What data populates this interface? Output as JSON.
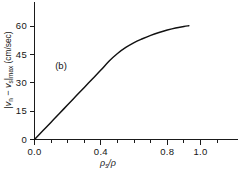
{
  "chart_data": {
    "type": "line",
    "title": "",
    "subtitle": "",
    "panel_label": "(b)",
    "xlabel": "ρs/ρ",
    "xlabel_main": "ρ",
    "xlabel_sub": "s",
    "xlabel_tail": "/ρ",
    "ylabel": "|vn − vs|max (cm/sec)",
    "ylabel_parts": {
      "bar_open": "|",
      "v1": "v",
      "v1_sub": "n",
      "dash": " − ",
      "v2": "v",
      "v2_sub": "s",
      "bar_close": "|",
      "max_sub": "max",
      "units": " (cm/sec)"
    },
    "xlim": [
      0.0,
      1.22
    ],
    "ylim": [
      0,
      72
    ],
    "xticks": [
      0.0,
      0.4,
      0.8,
      1.0
    ],
    "xticklabels": [
      "0.0",
      "0.4",
      "0.8",
      "1.0"
    ],
    "xminor_ticks": [
      0.1,
      0.2,
      0.3,
      0.5,
      0.6,
      0.7,
      0.9,
      1.1
    ],
    "yticks": [
      0,
      15,
      30,
      45,
      60
    ],
    "yticklabels": [
      "0",
      "15",
      "30",
      "45",
      "60"
    ],
    "grid": false,
    "legend": false,
    "legend_position": "none",
    "series": [
      {
        "name": "|vn - vs|max",
        "x": [
          0.0,
          0.05,
          0.1,
          0.15,
          0.2,
          0.25,
          0.3,
          0.35,
          0.4,
          0.45,
          0.5,
          0.55,
          0.6,
          0.65,
          0.7,
          0.75,
          0.8,
          0.85,
          0.9,
          0.93
        ],
        "y": [
          0.0,
          4.6,
          9.2,
          13.8,
          18.4,
          23.0,
          27.6,
          32.2,
          36.8,
          41.6,
          45.6,
          48.8,
          51.4,
          53.4,
          55.2,
          56.7,
          58.0,
          59.1,
          59.9,
          60.3
        ]
      }
    ],
    "curve_color": "#111111",
    "axis_color": "#1a1a1a",
    "background_color": "#ffffff"
  }
}
